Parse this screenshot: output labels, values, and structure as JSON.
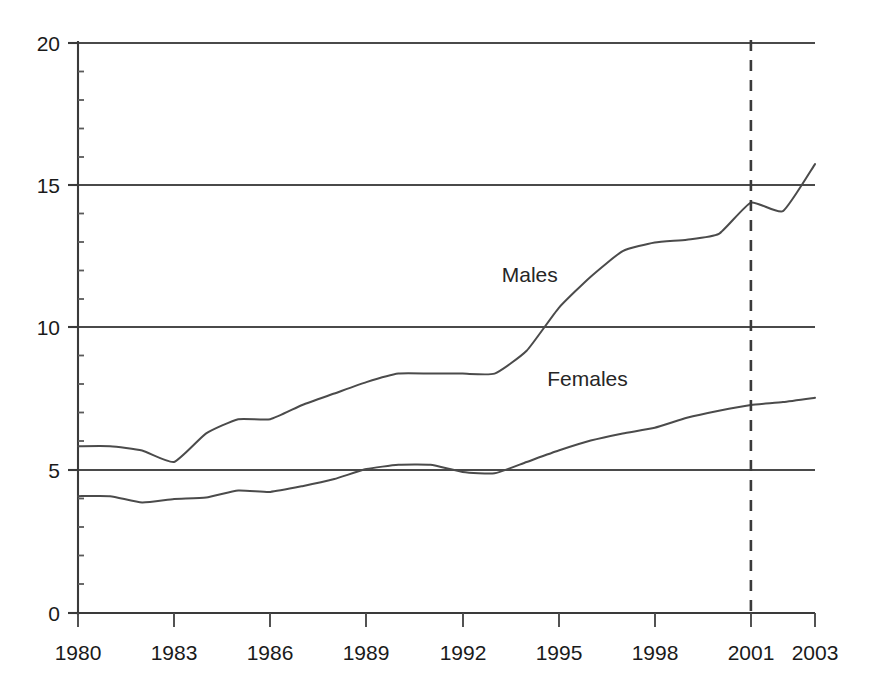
{
  "chart_data": {
    "type": "line",
    "title": "",
    "subtitle": "",
    "xlabel": "",
    "ylabel": "",
    "xlim": [
      1980,
      2003
    ],
    "ylim": [
      0,
      20
    ],
    "grid": "horizontal major gridlines at 0, 5, 10, 15, 20",
    "legend_position": "inline labels on plot",
    "x": [
      1980,
      1981,
      1982,
      1983,
      1984,
      1985,
      1986,
      1987,
      1988,
      1989,
      1990,
      1991,
      1992,
      1993,
      1994,
      1995,
      1996,
      1997,
      1998,
      1999,
      2000,
      2001,
      2002,
      2003
    ],
    "y_major_ticks": [
      0,
      5,
      10,
      15,
      20
    ],
    "y_minor_tick_step": 1,
    "x_tick_labels": [
      "1980",
      "1983",
      "1986",
      "1989",
      "1992",
      "1995",
      "1998",
      "2001",
      "2003"
    ],
    "x_tick_values": [
      1980,
      1983,
      1986,
      1989,
      1992,
      1995,
      1998,
      2001,
      2003
    ],
    "series": [
      {
        "name": "Males",
        "label": "Males",
        "label_x": 1994.1,
        "label_y": 11.6,
        "color": "#4b4b4b",
        "values": [
          5.85,
          5.85,
          5.7,
          5.3,
          6.3,
          6.8,
          6.8,
          7.3,
          7.7,
          8.1,
          8.4,
          8.4,
          8.4,
          8.4,
          9.2,
          10.7,
          11.8,
          12.7,
          13.0,
          13.1,
          13.3,
          14.4,
          14.1,
          15.75
        ]
      },
      {
        "name": "Females",
        "label": "Females",
        "label_x": 1995.9,
        "label_y": 7.95,
        "color": "#4b4b4b",
        "values": [
          4.1,
          4.1,
          3.88,
          4.0,
          4.05,
          4.3,
          4.25,
          4.45,
          4.7,
          5.05,
          5.2,
          5.2,
          4.95,
          4.9,
          5.3,
          5.7,
          6.05,
          6.3,
          6.5,
          6.85,
          7.1,
          7.3,
          7.4,
          7.55
        ]
      }
    ],
    "annotations": [
      {
        "name": "reference-line",
        "type": "vertical-dashed-line",
        "x": 2001,
        "y_from": 0,
        "y_to": 20,
        "color": "#3a3a3a"
      }
    ]
  },
  "axes": {
    "y_labels": [
      "20",
      "15",
      "10",
      "5",
      "0"
    ],
    "y_values": [
      20,
      15,
      10,
      5,
      0
    ],
    "x_labels": [
      "1980",
      "1983",
      "1986",
      "1989",
      "1992",
      "1995",
      "1998",
      "2001",
      "2003"
    ]
  },
  "labels": {
    "males": "Males",
    "females": "Females"
  }
}
